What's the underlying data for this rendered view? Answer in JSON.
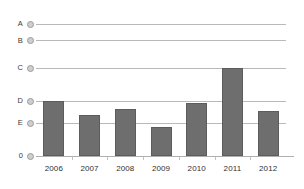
{
  "chart_data": {
    "type": "bar",
    "title": "",
    "subtitle": "",
    "xlabel": "",
    "ylabel": "",
    "categories": [
      "2006",
      "2007",
      "2008",
      "2009",
      "2010",
      "2011",
      "2012"
    ],
    "values": [
      5.0,
      3.7,
      4.3,
      2.6,
      4.8,
      8.0,
      4.1
    ],
    "series": [
      {
        "name": "",
        "values": [
          5.0,
          3.7,
          4.3,
          2.6,
          4.8,
          8.0,
          4.1
        ]
      }
    ],
    "ytick_labels": [
      "A",
      "B",
      "C",
      "D",
      "E",
      "0"
    ],
    "ytick_values": [
      12.0,
      10.5,
      8.0,
      5.0,
      3.0,
      0
    ],
    "ylim": [
      0,
      13.2
    ],
    "grid": true,
    "legend": false,
    "bar_color": "#6e6e6e",
    "grid_color": "#b9b9b9",
    "marker_color": "#cfcfcf"
  },
  "axes": {
    "y": {
      "ticks": [
        {
          "label": "A",
          "value": 12.0
        },
        {
          "label": "B",
          "value": 10.5
        },
        {
          "label": "C",
          "value": 8.0
        },
        {
          "label": "D",
          "value": 5.0
        },
        {
          "label": "E",
          "value": 3.0
        },
        {
          "label": "0",
          "value": 0
        }
      ]
    },
    "x": {
      "ticks": [
        {
          "label": "2006"
        },
        {
          "label": "2007"
        },
        {
          "label": "2008"
        },
        {
          "label": "2009"
        },
        {
          "label": "2010"
        },
        {
          "label": "2011"
        },
        {
          "label": "2012"
        }
      ]
    }
  }
}
